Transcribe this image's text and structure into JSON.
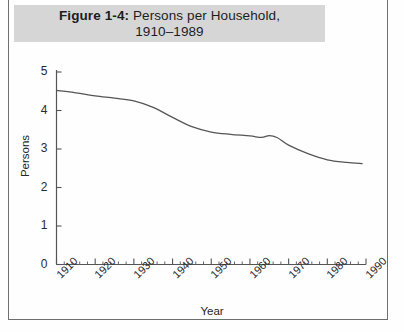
{
  "figure": {
    "title_bold": "Figure 1-4:",
    "title_rest": " Persons per Household,",
    "title_line2": "1910–1989"
  },
  "chart_data": {
    "type": "line",
    "xlabel": "Year",
    "ylabel": "Persons",
    "xlim": [
      1910,
      1990
    ],
    "ylim": [
      0,
      5
    ],
    "xticks": [
      1910,
      1920,
      1930,
      1940,
      1950,
      1960,
      1970,
      1980,
      1990
    ],
    "xtick_labels": [
      "1910",
      "1920",
      "1930",
      "1940",
      "1950",
      "1960",
      "1970",
      "1980",
      "1990"
    ],
    "yticks": [
      0,
      1,
      2,
      3,
      4,
      5
    ],
    "ytick_labels": [
      "0",
      "1",
      "2",
      "3",
      "4",
      "5"
    ],
    "minor_xtick_interval": 2,
    "grid": false,
    "legend": false,
    "line_color": "#555555",
    "series": [
      {
        "name": "Persons per Household",
        "x": [
          1910,
          1915,
          1920,
          1925,
          1930,
          1935,
          1940,
          1945,
          1950,
          1955,
          1960,
          1963,
          1965,
          1967,
          1970,
          1975,
          1980,
          1985,
          1989
        ],
        "values": [
          4.52,
          4.46,
          4.38,
          4.32,
          4.25,
          4.08,
          3.82,
          3.58,
          3.44,
          3.38,
          3.34,
          3.3,
          3.35,
          3.3,
          3.1,
          2.88,
          2.72,
          2.65,
          2.62
        ]
      }
    ]
  },
  "axis_labels": {
    "x_title": "Year",
    "y_title": "Persons"
  }
}
